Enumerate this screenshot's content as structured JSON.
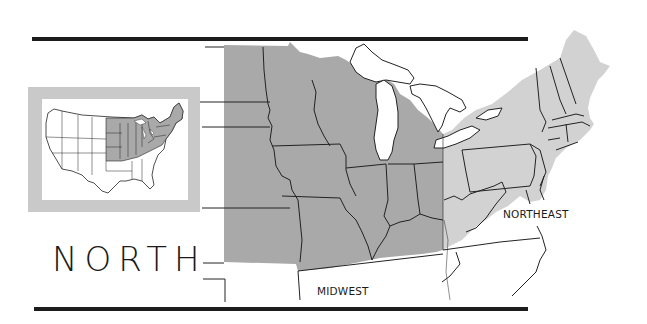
{
  "title": "NORTH",
  "regions": [
    {
      "name": "MIDWEST",
      "fill": "#a9a9a9"
    },
    {
      "name": "NORTHEAST",
      "fill": "#d2d2d2"
    }
  ],
  "labels": {
    "midwest": "MIDWEST",
    "northeast": "NORTHEAST"
  },
  "colors": {
    "rule": "#1c1c1c",
    "midwest_fill": "#a9a9a9",
    "northeast_fill": "#d2d2d2",
    "inset_frame": "#c9c9c9",
    "water": "#ffffff",
    "border": "#222222"
  },
  "inset": {
    "description": "Locator map of the contiguous United States with northern states shaded"
  }
}
